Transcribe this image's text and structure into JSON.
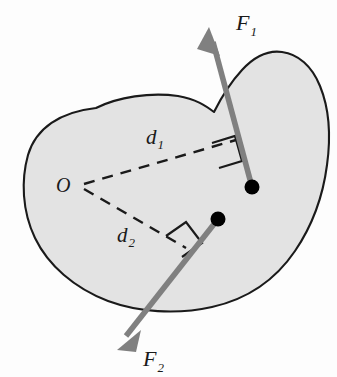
{
  "diagram": {
    "type": "free-body-diagram",
    "body_label": "rigid-body",
    "colors": {
      "background": "#fdfdfd",
      "body_fill": "#e3e3e3",
      "body_stroke": "#1a1a1a",
      "force_vector": "#808080",
      "moment_arm": "#1a1a1a",
      "application_point": "#000000",
      "label_text": "#1a1a1a"
    },
    "labels": {
      "force1": "F",
      "force1_sub": "1",
      "force2": "F",
      "force2_sub": "2",
      "arm1": "d",
      "arm1_sub": "1",
      "arm2": "d",
      "arm2_sub": "2",
      "pivot": "O"
    },
    "geometry": {
      "pivot_point": {
        "x": 82,
        "y": 185
      },
      "force1_application_point": {
        "x": 252,
        "y": 187
      },
      "force2_application_point": {
        "x": 218,
        "y": 219
      },
      "force1_arrow_tip": {
        "x": 209,
        "y": 27
      },
      "force2_arrow_tip": {
        "x": 117,
        "y": 350
      },
      "force1_label_pos": {
        "x": 236,
        "y": 30
      },
      "force2_label_pos": {
        "x": 143,
        "y": 366
      },
      "arm1_label_pos": {
        "x": 146,
        "y": 144
      },
      "arm2_label_pos": {
        "x": 117,
        "y": 242
      },
      "pivot_label_pos": {
        "x": 56,
        "y": 192
      },
      "right_angle_1": {
        "x": 224,
        "y": 150
      },
      "right_angle_2": {
        "x": 178,
        "y": 239
      }
    }
  }
}
